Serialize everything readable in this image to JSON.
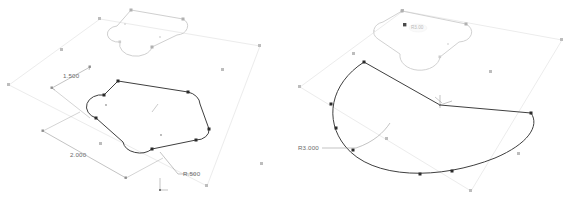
{
  "app": {
    "title": "CAD Sketch Viewport",
    "background_color": "#ffffff"
  },
  "palette": {
    "plane_edge": "#e8e8e8",
    "plane_edge_soft": "#f0f0f0",
    "sketch_active": "#3a3a3a",
    "sketch_inactive": "#c8c8c8",
    "handle_dark": "#2b2b2b",
    "handle_light": "#b5b5b5",
    "dimension_line": "#8d8d8d",
    "dimension_text": "#6b6b6b",
    "origin_marker": "#9a9a9a",
    "tooltip_text": "#b9b9b9"
  },
  "views": [
    {
      "id": "left-view",
      "name": "rounded-rectangle-sketch-view",
      "label": "Left isometric sketch view",
      "shapes": [
        {
          "name": "reference-plane",
          "type": "parallelogram",
          "state": "construction"
        },
        {
          "name": "upper-rounded-profile",
          "type": "rounded-rectangle",
          "state": "inactive"
        },
        {
          "name": "active-rounded-profile",
          "type": "rounded-rectangle",
          "state": "active"
        }
      ],
      "dimensions": [
        {
          "name": "width-dimension",
          "value": "1.500",
          "x": 63,
          "y": 78
        },
        {
          "name": "length-dimension",
          "value": "2.000",
          "x": 70,
          "y": 157
        },
        {
          "name": "corner-radius-dimension",
          "value": "R.500",
          "x": 183,
          "y": 176
        }
      ],
      "origin": {
        "name": "sketch-origin-marker",
        "x": 160,
        "y": 182
      }
    },
    {
      "id": "right-view",
      "name": "arc-sector-sketch-view",
      "label": "Right isometric sketch view",
      "shapes": [
        {
          "name": "reference-plane",
          "type": "parallelogram",
          "state": "construction"
        },
        {
          "name": "upper-rounded-profile",
          "type": "rounded-rectangle",
          "state": "inactive"
        },
        {
          "name": "active-sector-profile",
          "type": "circular-sector",
          "state": "active"
        }
      ],
      "dimensions": [
        {
          "name": "arc-radius-dimension",
          "value": "R3.000",
          "x": 298,
          "y": 150
        }
      ],
      "origin": {
        "name": "sketch-origin-marker",
        "x": 440,
        "y": 100
      },
      "tooltip": {
        "name": "handle-tooltip",
        "value": "R3.00",
        "x": 404,
        "y": 28
      }
    }
  ]
}
